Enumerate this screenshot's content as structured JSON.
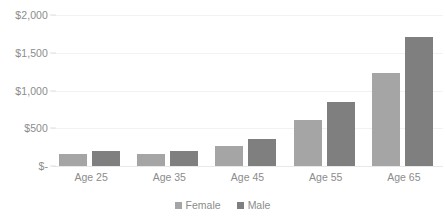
{
  "chart_data": {
    "type": "bar",
    "title": "",
    "subtitle": "",
    "xlabel": "",
    "ylabel": "",
    "categories": [
      "Age 25",
      "Age 35",
      "Age 45",
      "Age 55",
      "Age 65"
    ],
    "series": [
      {
        "name": "Female",
        "color": "#a5a5a5",
        "values": [
          160,
          160,
          265,
          610,
          1230
        ]
      },
      {
        "name": "Male",
        "color": "#7f7f7f",
        "values": [
          205,
          205,
          360,
          850,
          1710
        ]
      }
    ],
    "ylim": [
      0,
      2000
    ],
    "yticks": [
      0,
      500,
      1000,
      1500,
      2000
    ],
    "ytick_labels": [
      "$-",
      "$500",
      "$1,000",
      "$1,500",
      "$2,000"
    ],
    "grid": true,
    "legend_position": "bottom",
    "annotations": []
  },
  "legend": {
    "items": [
      {
        "label": "Female",
        "color": "#a5a5a5"
      },
      {
        "label": "Male",
        "color": "#7f7f7f"
      }
    ]
  },
  "colors": {
    "female": "#a5a5a5",
    "male": "#7f7f7f",
    "gridline": "#f2f2f2",
    "axis_text": "#8c8c8c",
    "background": "#ffffff"
  }
}
